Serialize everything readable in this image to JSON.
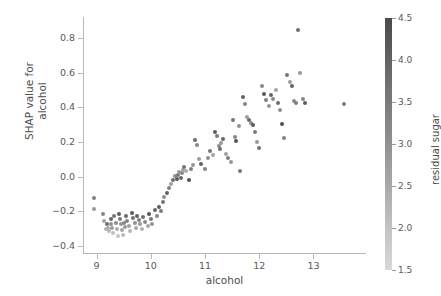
{
  "chart_data": {
    "type": "scatter",
    "title": "",
    "xlabel": "alcohol",
    "ylabel": "SHAP value for\nalcohol",
    "ylabel_line1": "SHAP value for",
    "ylabel_line2": "alcohol",
    "xlim": [
      8.75,
      13.95
    ],
    "ylim": [
      -0.44,
      0.92
    ],
    "xticks": [
      9,
      10,
      11,
      12,
      13
    ],
    "xticklabels": [
      "9",
      "10",
      "11",
      "12",
      "13"
    ],
    "yticks": [
      0.8,
      0.6,
      0.4,
      0.2,
      0.0,
      -0.2,
      -0.4
    ],
    "yticklabels": [
      "0.8",
      "0.6",
      "0.4",
      "0.2",
      "0.0",
      "−0.2",
      "−0.4"
    ],
    "grid": false,
    "legend": null,
    "marker_color": "#4d4d4d",
    "colorbar": {
      "label": "residual sugar",
      "ticks": [
        4.5,
        4.0,
        3.5,
        3.0,
        2.5,
        2.0,
        1.5
      ],
      "ticklabels": [
        "4.5",
        "4.0",
        "3.5",
        "3.0",
        "2.5",
        "2.0",
        "1.5"
      ],
      "vmin": 1.5,
      "vmax": 4.5,
      "cmap": "gray_reversed",
      "color_top": "#4a4a4a",
      "color_bottom": "#d8d8d8",
      "orientation": "vertical",
      "position": "right"
    },
    "points": [
      {
        "x": 8.95,
        "y": -0.125,
        "c": 3.2
      },
      {
        "x": 8.96,
        "y": -0.185,
        "c": 2.6
      },
      {
        "x": 9.12,
        "y": -0.215,
        "c": 3.1
      },
      {
        "x": 9.13,
        "y": -0.255,
        "c": 2.4
      },
      {
        "x": 9.18,
        "y": -0.3,
        "c": 2.0
      },
      {
        "x": 9.2,
        "y": -0.27,
        "c": 3.6
      },
      {
        "x": 9.21,
        "y": -0.295,
        "c": 2.2
      },
      {
        "x": 9.23,
        "y": -0.315,
        "c": 1.9
      },
      {
        "x": 9.26,
        "y": -0.245,
        "c": 3.8
      },
      {
        "x": 9.27,
        "y": -0.27,
        "c": 2.8
      },
      {
        "x": 9.29,
        "y": -0.295,
        "c": 2.5
      },
      {
        "x": 9.3,
        "y": -0.325,
        "c": 1.7
      },
      {
        "x": 9.33,
        "y": -0.225,
        "c": 3.4
      },
      {
        "x": 9.35,
        "y": -0.265,
        "c": 2.9
      },
      {
        "x": 9.37,
        "y": -0.3,
        "c": 2.1
      },
      {
        "x": 9.39,
        "y": -0.34,
        "c": 1.6
      },
      {
        "x": 9.42,
        "y": -0.215,
        "c": 4.0
      },
      {
        "x": 9.44,
        "y": -0.245,
        "c": 3.3
      },
      {
        "x": 9.45,
        "y": -0.275,
        "c": 2.7
      },
      {
        "x": 9.47,
        "y": -0.305,
        "c": 2.3
      },
      {
        "x": 9.49,
        "y": -0.335,
        "c": 1.8
      },
      {
        "x": 9.5,
        "y": -0.265,
        "c": 3.0
      },
      {
        "x": 9.52,
        "y": -0.29,
        "c": 2.5
      },
      {
        "x": 9.55,
        "y": -0.225,
        "c": 3.7
      },
      {
        "x": 9.57,
        "y": -0.255,
        "c": 3.1
      },
      {
        "x": 9.6,
        "y": -0.285,
        "c": 2.4
      },
      {
        "x": 9.62,
        "y": -0.315,
        "c": 1.9
      },
      {
        "x": 9.65,
        "y": -0.21,
        "c": 4.1
      },
      {
        "x": 9.68,
        "y": -0.24,
        "c": 3.5
      },
      {
        "x": 9.7,
        "y": -0.265,
        "c": 2.8
      },
      {
        "x": 9.72,
        "y": -0.295,
        "c": 2.2
      },
      {
        "x": 9.75,
        "y": -0.225,
        "c": 3.9
      },
      {
        "x": 9.78,
        "y": -0.25,
        "c": 3.2
      },
      {
        "x": 9.8,
        "y": -0.275,
        "c": 2.6
      },
      {
        "x": 9.83,
        "y": -0.3,
        "c": 2.0
      },
      {
        "x": 9.86,
        "y": -0.235,
        "c": 3.6
      },
      {
        "x": 9.9,
        "y": -0.26,
        "c": 2.9
      },
      {
        "x": 9.94,
        "y": -0.285,
        "c": 2.3
      },
      {
        "x": 9.97,
        "y": -0.215,
        "c": 4.2
      },
      {
        "x": 10.0,
        "y": -0.245,
        "c": 3.4
      },
      {
        "x": 10.03,
        "y": -0.27,
        "c": 2.7
      },
      {
        "x": 10.08,
        "y": -0.195,
        "c": 3.8
      },
      {
        "x": 10.12,
        "y": -0.225,
        "c": 3.0
      },
      {
        "x": 10.15,
        "y": -0.175,
        "c": 4.0
      },
      {
        "x": 10.18,
        "y": -0.2,
        "c": 3.3
      },
      {
        "x": 10.22,
        "y": -0.145,
        "c": 3.5
      },
      {
        "x": 10.25,
        "y": -0.12,
        "c": 2.8
      },
      {
        "x": 10.3,
        "y": -0.095,
        "c": 3.9
      },
      {
        "x": 10.33,
        "y": -0.065,
        "c": 3.1
      },
      {
        "x": 10.38,
        "y": -0.045,
        "c": 2.5
      },
      {
        "x": 10.41,
        "y": -0.02,
        "c": 3.6
      },
      {
        "x": 10.45,
        "y": 0.005,
        "c": 2.9
      },
      {
        "x": 10.48,
        "y": -0.015,
        "c": 4.1
      },
      {
        "x": 10.5,
        "y": 0.01,
        "c": 3.3
      },
      {
        "x": 10.52,
        "y": 0.025,
        "c": 2.6
      },
      {
        "x": 10.55,
        "y": -0.005,
        "c": 3.8
      },
      {
        "x": 10.58,
        "y": 0.02,
        "c": 3.0
      },
      {
        "x": 10.6,
        "y": 0.04,
        "c": 2.4
      },
      {
        "x": 10.62,
        "y": 0.055,
        "c": 3.5
      },
      {
        "x": 10.65,
        "y": 0.03,
        "c": 2.2
      },
      {
        "x": 10.7,
        "y": -0.02,
        "c": 4.3
      },
      {
        "x": 10.74,
        "y": 0.045,
        "c": 3.2
      },
      {
        "x": 10.78,
        "y": 0.065,
        "c": 2.7
      },
      {
        "x": 10.82,
        "y": 0.21,
        "c": 3.7
      },
      {
        "x": 10.85,
        "y": 0.185,
        "c": 3.0
      },
      {
        "x": 10.88,
        "y": 0.1,
        "c": 2.5
      },
      {
        "x": 10.92,
        "y": 0.075,
        "c": 3.9
      },
      {
        "x": 11.0,
        "y": 0.045,
        "c": 3.1
      },
      {
        "x": 11.05,
        "y": 0.11,
        "c": 2.8
      },
      {
        "x": 11.1,
        "y": 0.145,
        "c": 3.4
      },
      {
        "x": 11.15,
        "y": 0.125,
        "c": 2.3
      },
      {
        "x": 11.18,
        "y": 0.255,
        "c": 4.0
      },
      {
        "x": 11.22,
        "y": 0.235,
        "c": 3.3
      },
      {
        "x": 11.25,
        "y": 0.175,
        "c": 2.9
      },
      {
        "x": 11.28,
        "y": 0.16,
        "c": 3.6
      },
      {
        "x": 11.3,
        "y": 0.195,
        "c": 2.6
      },
      {
        "x": 11.33,
        "y": 0.215,
        "c": 3.8
      },
      {
        "x": 11.38,
        "y": 0.13,
        "c": 2.4
      },
      {
        "x": 11.42,
        "y": 0.105,
        "c": 3.2
      },
      {
        "x": 11.48,
        "y": 0.085,
        "c": 2.7
      },
      {
        "x": 11.52,
        "y": 0.325,
        "c": 3.5
      },
      {
        "x": 11.55,
        "y": 0.23,
        "c": 3.0
      },
      {
        "x": 11.58,
        "y": 0.205,
        "c": 4.2
      },
      {
        "x": 11.62,
        "y": 0.29,
        "c": 2.8
      },
      {
        "x": 11.65,
        "y": 0.035,
        "c": 3.4
      },
      {
        "x": 11.7,
        "y": 0.46,
        "c": 3.9
      },
      {
        "x": 11.74,
        "y": 0.42,
        "c": 3.1
      },
      {
        "x": 11.78,
        "y": 0.345,
        "c": 2.5
      },
      {
        "x": 11.82,
        "y": 0.325,
        "c": 3.7
      },
      {
        "x": 11.85,
        "y": 0.31,
        "c": 2.9
      },
      {
        "x": 11.88,
        "y": 0.3,
        "c": 4.0
      },
      {
        "x": 11.92,
        "y": 0.255,
        "c": 3.3
      },
      {
        "x": 11.95,
        "y": 0.2,
        "c": 2.6
      },
      {
        "x": 12.0,
        "y": 0.165,
        "c": 3.5
      },
      {
        "x": 12.05,
        "y": 0.52,
        "c": 3.0
      },
      {
        "x": 12.08,
        "y": 0.475,
        "c": 4.1
      },
      {
        "x": 12.12,
        "y": 0.44,
        "c": 3.2
      },
      {
        "x": 12.18,
        "y": 0.41,
        "c": 2.7
      },
      {
        "x": 12.22,
        "y": 0.47,
        "c": 3.8
      },
      {
        "x": 12.26,
        "y": 0.45,
        "c": 3.0
      },
      {
        "x": 12.3,
        "y": 0.5,
        "c": 2.4
      },
      {
        "x": 12.34,
        "y": 0.425,
        "c": 3.6
      },
      {
        "x": 12.38,
        "y": 0.385,
        "c": 2.8
      },
      {
        "x": 12.42,
        "y": 0.305,
        "c": 4.3
      },
      {
        "x": 12.46,
        "y": 0.225,
        "c": 3.1
      },
      {
        "x": 12.52,
        "y": 0.585,
        "c": 3.4
      },
      {
        "x": 12.56,
        "y": 0.545,
        "c": 2.5
      },
      {
        "x": 12.6,
        "y": 0.525,
        "c": 3.9
      },
      {
        "x": 12.64,
        "y": 0.435,
        "c": 2.9
      },
      {
        "x": 12.68,
        "y": 0.425,
        "c": 3.2
      },
      {
        "x": 12.72,
        "y": 0.845,
        "c": 3.6
      },
      {
        "x": 12.76,
        "y": 0.595,
        "c": 2.6
      },
      {
        "x": 12.8,
        "y": 0.445,
        "c": 3.0
      },
      {
        "x": 12.84,
        "y": 0.425,
        "c": 4.0
      },
      {
        "x": 13.57,
        "y": 0.42,
        "c": 3.3
      }
    ]
  },
  "figure": {
    "background": "#ffffff",
    "axis_color": "#b8b8b8",
    "text_color": "#4d4d4d",
    "tick_text_color": "#595959"
  }
}
